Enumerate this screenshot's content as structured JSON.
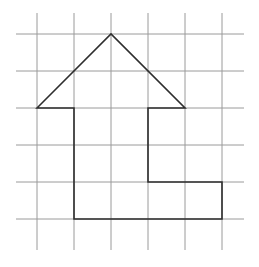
{
  "diagram": {
    "type": "grid-figure",
    "colors": {
      "background": "#ffffff",
      "grid": "#9a9a9a",
      "outline": "#2e2e2e"
    },
    "grid": {
      "cell_size_px": 37,
      "vertical_x": [
        37,
        74,
        111,
        148,
        185,
        222
      ],
      "vertical_y_range": [
        13,
        250
      ],
      "horizontal_y": [
        34,
        71,
        108,
        145,
        182,
        219
      ],
      "horizontal_x_range": [
        16,
        244
      ]
    },
    "shape": {
      "name": "arrow-l-shape",
      "vertices_grid_units": [
        [
          0,
          2
        ],
        [
          2,
          0
        ],
        [
          4,
          2
        ],
        [
          3,
          2
        ],
        [
          3,
          4
        ],
        [
          5,
          4
        ],
        [
          5,
          5
        ],
        [
          1,
          5
        ],
        [
          1,
          2
        ]
      ],
      "points": "37,108 111,34 185,108 148,108 148,182 222,182 222,219 74,219 74,108"
    }
  }
}
